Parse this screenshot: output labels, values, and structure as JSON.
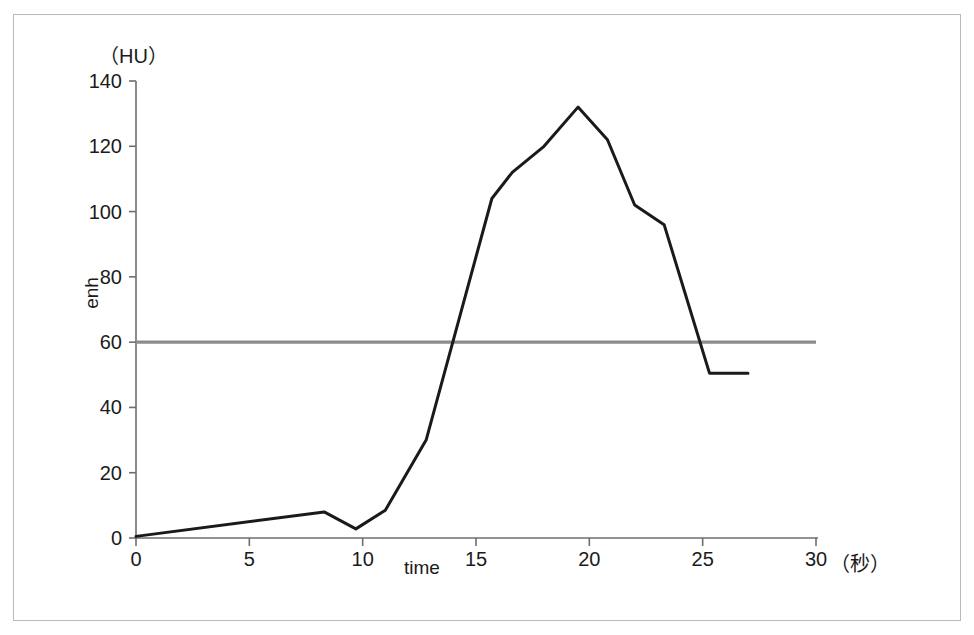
{
  "chart_data": {
    "type": "line",
    "title": "",
    "xlabel": "time",
    "ylabel": "enh",
    "x_unit": "（秒）",
    "y_unit": "（HU）",
    "xlim": [
      0,
      30
    ],
    "ylim": [
      0,
      140
    ],
    "xticks": [
      0,
      5,
      10,
      15,
      20,
      25,
      30
    ],
    "yticks": [
      0,
      20,
      40,
      60,
      80,
      100,
      120,
      140
    ],
    "xtick_labels": [
      "0",
      "5",
      "10",
      "15",
      "20",
      "25",
      "30"
    ],
    "ytick_labels": [
      "0",
      "20",
      "40",
      "60",
      "80",
      "100",
      "120",
      "140"
    ],
    "grid": false,
    "legend": "none",
    "series": [
      {
        "name": "enhancement curve",
        "color": "#1a1a1a",
        "x": [
          0.0,
          8.3,
          9.7,
          11.0,
          12.8,
          15.7,
          16.6,
          18.0,
          19.5,
          20.8,
          22.0,
          23.3,
          25.3,
          27.0
        ],
        "y": [
          0.5,
          8.0,
          2.8,
          8.5,
          30.0,
          104.0,
          112.0,
          120.0,
          132.0,
          122.0,
          102.0,
          96.0,
          50.5,
          50.5
        ]
      }
    ],
    "reference_line": {
      "name": "threshold-60HU",
      "value": 60,
      "color": "#8c8c8c",
      "x_start": 0,
      "x_end": 30,
      "style": "solid"
    },
    "annotations": []
  },
  "axis": {
    "unit_y": "（HU）",
    "unit_x": "（秒）",
    "label_x": "time",
    "label_y": "enh"
  },
  "colors": {
    "curve": "#1a1a1a",
    "axis": "#6e6e6e",
    "reference": "#8c8c8c",
    "frame": "#b9b9b9",
    "text": "#1b1b1b",
    "background": "#ffffff"
  }
}
